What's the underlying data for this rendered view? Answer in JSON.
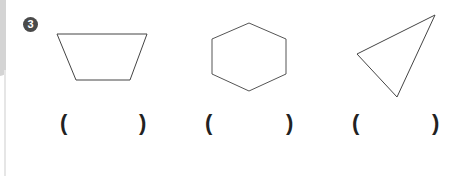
{
  "question": {
    "number": "3",
    "items": [
      {
        "shape": "trapezoid",
        "answer_open": "(",
        "answer_close": ")"
      },
      {
        "shape": "hexagon",
        "answer_open": "(",
        "answer_close": ")"
      },
      {
        "shape": "triangle",
        "answer_open": "(",
        "answer_close": ")"
      }
    ]
  },
  "colors": {
    "badge": "#4a4a4a",
    "stroke": "#444444",
    "sidebar": "#d4d4d4"
  }
}
